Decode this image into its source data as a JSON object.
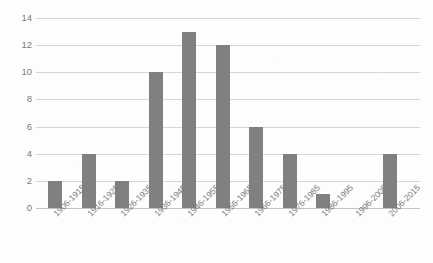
{
  "chart_data": {
    "type": "bar",
    "title": "",
    "xlabel": "",
    "ylabel": "",
    "categories": [
      "1906-1915",
      "1916-1925",
      "1926-1935",
      "1936-1945",
      "1946-1955",
      "1956-1965",
      "1966-1975",
      "1976-1985",
      "1986-1995",
      "1996-2005",
      "2006-2015"
    ],
    "values": [
      2,
      4,
      2,
      10,
      13,
      12,
      6,
      4,
      1,
      0,
      4
    ],
    "ylim": [
      0,
      14
    ],
    "yticks": [
      0,
      2,
      4,
      6,
      8,
      10,
      12,
      14
    ],
    "ytick_labels": [
      "0",
      "2",
      "4",
      "6",
      "8",
      "10",
      "12",
      "14"
    ],
    "grid": true,
    "legend": false,
    "legend_position": "none",
    "colors": {
      "bar": "#808080",
      "gridline": "#d6d6d6",
      "baseline": "#c4c4c4",
      "tick_text": "#7b7b7b",
      "background": "#fdfdfd"
    }
  }
}
